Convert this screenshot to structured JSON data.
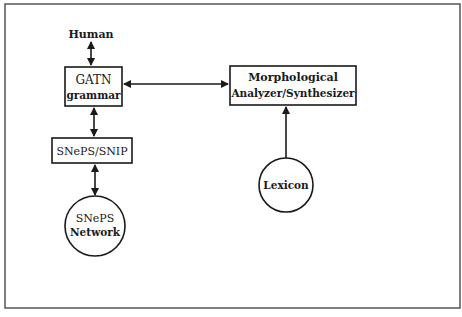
{
  "diagram": {
    "nodes": {
      "human": {
        "label": "Human"
      },
      "gatn": {
        "line1": "GATN",
        "line2": "grammar"
      },
      "morph": {
        "line1": "Morphological",
        "line2": "Analyzer/Synthesizer"
      },
      "snip": {
        "label": "SNePS/SNIP"
      },
      "network": {
        "line1": "SNePS",
        "line2": "Network"
      },
      "lexicon": {
        "label": "Lexicon"
      }
    },
    "edges": [
      {
        "from": "human",
        "to": "gatn",
        "type": "bidirectional"
      },
      {
        "from": "gatn",
        "to": "morph",
        "type": "bidirectional"
      },
      {
        "from": "gatn",
        "to": "snip",
        "type": "bidirectional"
      },
      {
        "from": "snip",
        "to": "network",
        "type": "bidirectional"
      },
      {
        "from": "lexicon",
        "to": "morph",
        "type": "directed"
      }
    ],
    "colors": {
      "stroke": "#1a1a1a",
      "background": "#ffffff",
      "frame": "#555555"
    }
  }
}
